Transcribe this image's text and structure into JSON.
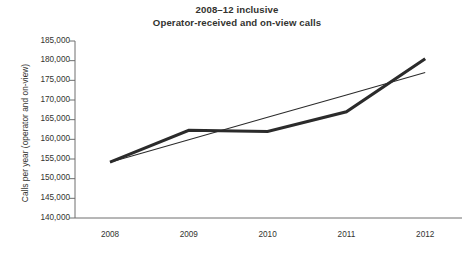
{
  "chart_data": {
    "type": "line",
    "title": "2008–12 inclusive",
    "subtitle": "Operator-received and on-view calls",
    "xlabel": "",
    "ylabel": "Calls per year (operator and on-view)",
    "x": [
      2008,
      2009,
      2010,
      2011,
      2012
    ],
    "categories": [
      "2008",
      "2009",
      "2010",
      "2011",
      "2012"
    ],
    "ylim": [
      140000,
      185000
    ],
    "ytick_step": 5000,
    "ytick_labels": [
      "185,000",
      "180,000",
      "175,000",
      "170,000",
      "165,000",
      "160,000",
      "155,000",
      "150,000",
      "145,000",
      "140,000"
    ],
    "ytick_values": [
      185000,
      180000,
      175000,
      170000,
      165000,
      160000,
      155000,
      150000,
      145000,
      140000
    ],
    "grid": false,
    "legend": false,
    "legend_position": "none",
    "series": [
      {
        "name": "Operator-received and on-view calls",
        "kind": "data",
        "values": [
          154200,
          162300,
          162000,
          167000,
          180500
        ],
        "color": "#2b2b2b",
        "line_width": 3.1
      },
      {
        "name": "Linear trendline",
        "kind": "trend",
        "values": [
          154200,
          159900,
          165600,
          171300,
          177000
        ],
        "color": "#2b2b2b",
        "line_width": 1.05
      }
    ],
    "annotations": []
  },
  "axes": {
    "y_axis_title": "Calls per year (operator and on-view)",
    "x_axis_title": ""
  },
  "colors": {
    "background": "#ffffff",
    "text": "#33332f",
    "axis": "#6e6e6e",
    "series": "#2b2b2b"
  }
}
